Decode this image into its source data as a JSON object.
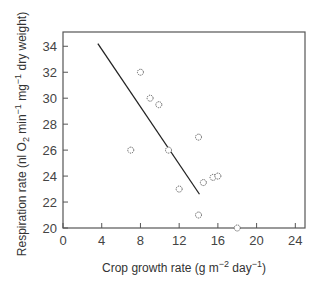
{
  "chart_data": {
    "type": "scatter",
    "title": "",
    "xlabel": "Crop growth rate (g m^-2 day^-1)",
    "xlabel_parts": {
      "pre": "Crop growth rate (g m",
      "sup1": "−2",
      "mid": " day",
      "sup2": "−1",
      "post": ")"
    },
    "ylabel": "Respiration rate (nl O2 min^-1 mg^-1 dry weight)",
    "ylabel_parts": {
      "pre": "Respiration rate (nl O",
      "sub": "2",
      "mid1": " min",
      "sup1": "−1",
      "mid2": " mg",
      "sup2": "−1",
      "post": " dry weight)"
    },
    "xlim": [
      0,
      25
    ],
    "ylim": [
      20,
      35.1
    ],
    "x_ticks": [
      0,
      4,
      8,
      12,
      16,
      20,
      24
    ],
    "y_ticks": [
      20,
      22,
      24,
      26,
      28,
      30,
      32,
      34
    ],
    "grid": false,
    "legend": null,
    "series": [
      {
        "name": "observations",
        "marker": "open-circle",
        "points": [
          {
            "x": 7.0,
            "y": 26.0
          },
          {
            "x": 8.0,
            "y": 32.0
          },
          {
            "x": 9.0,
            "y": 30.0
          },
          {
            "x": 9.9,
            "y": 29.5
          },
          {
            "x": 10.9,
            "y": 26.0
          },
          {
            "x": 12.0,
            "y": 23.0
          },
          {
            "x": 14.0,
            "y": 27.0
          },
          {
            "x": 14.5,
            "y": 23.5
          },
          {
            "x": 15.5,
            "y": 23.9
          },
          {
            "x": 16.0,
            "y": 24.0
          },
          {
            "x": 14.0,
            "y": 21.0
          },
          {
            "x": 18.0,
            "y": 20.0
          }
        ]
      },
      {
        "name": "regression line",
        "type": "line",
        "points": [
          {
            "x": 3.6,
            "y": 34.2
          },
          {
            "x": 14.1,
            "y": 22.6
          }
        ]
      }
    ]
  }
}
